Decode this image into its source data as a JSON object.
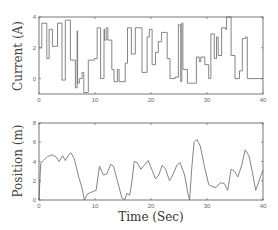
{
  "chart_data": [
    {
      "type": "line",
      "step": true,
      "title": "",
      "xlabel": "",
      "ylabel": "Current (A)",
      "xlim": [
        0,
        40
      ],
      "ylim": [
        -1,
        4
      ],
      "xticks": [
        0,
        10,
        20,
        30,
        40
      ],
      "yticks": [
        0,
        2,
        4
      ],
      "grid": false,
      "series": [
        {
          "name": "Current",
          "color": "#777777",
          "points": [
            [
              0,
              2.0
            ],
            [
              0.5,
              3.6
            ],
            [
              1.4,
              1.3
            ],
            [
              1.8,
              3.2
            ],
            [
              2.4,
              2.1
            ],
            [
              3.3,
              3.6
            ],
            [
              4.1,
              -0.1
            ],
            [
              4.7,
              3.8
            ],
            [
              5.6,
              1.2
            ],
            [
              6.5,
              -0.6
            ],
            [
              6.8,
              3.1
            ],
            [
              6.9,
              -0.3
            ],
            [
              7.2,
              0.0
            ],
            [
              7.7,
              0.4
            ],
            [
              8.0,
              -0.9
            ],
            [
              8.6,
              -0.9
            ],
            [
              8.8,
              1.2
            ],
            [
              9.9,
              1.3
            ],
            [
              10.4,
              3.3
            ],
            [
              11.0,
              0.0
            ],
            [
              11.6,
              3.2
            ],
            [
              11.7,
              2.5
            ],
            [
              12.0,
              3.3
            ],
            [
              12.3,
              2.5
            ],
            [
              13.0,
              0.6
            ],
            [
              13.4,
              -0.2
            ],
            [
              14.0,
              0.6
            ],
            [
              14.3,
              -0.2
            ],
            [
              15.4,
              1.0
            ],
            [
              15.8,
              3.3
            ],
            [
              16.5,
              1.6
            ],
            [
              17.2,
              3.3
            ],
            [
              18.4,
              0.4
            ],
            [
              19.3,
              2.7
            ],
            [
              19.7,
              3.2
            ],
            [
              20.2,
              0.9
            ],
            [
              20.8,
              1.7
            ],
            [
              21.3,
              2.4
            ],
            [
              21.9,
              3.0
            ],
            [
              22.9,
              1.3
            ],
            [
              23.4,
              0.0
            ],
            [
              24.3,
              0.1
            ],
            [
              24.9,
              3.5
            ],
            [
              25.3,
              -0.2
            ],
            [
              25.5,
              3.6
            ],
            [
              25.7,
              0.6
            ],
            [
              26.5,
              -0.3
            ],
            [
              27.7,
              -0.3
            ],
            [
              28.1,
              1.4
            ],
            [
              28.6,
              1.1
            ],
            [
              28.9,
              1.4
            ],
            [
              29.6,
              0.9
            ],
            [
              30.3,
              0.0
            ],
            [
              30.7,
              2.9
            ],
            [
              31.3,
              1.3
            ],
            [
              31.7,
              2.7
            ],
            [
              32.0,
              1.5
            ],
            [
              32.6,
              3.3
            ],
            [
              33.3,
              3.2
            ],
            [
              33.5,
              4.0
            ],
            [
              34.3,
              1.5
            ],
            [
              35.0,
              0.0
            ],
            [
              35.8,
              0.5
            ],
            [
              36.3,
              2.6
            ],
            [
              36.9,
              2.7
            ],
            [
              37.2,
              0.0
            ]
          ]
        }
      ]
    },
    {
      "type": "line",
      "title": "",
      "xlabel": "Time (Sec)",
      "ylabel": "Position (m)",
      "xlim": [
        0,
        40
      ],
      "ylim": [
        0,
        8
      ],
      "xticks": [
        0,
        10,
        20,
        30,
        40
      ],
      "yticks": [
        0,
        2,
        4,
        6,
        8
      ],
      "grid": false,
      "series": [
        {
          "name": "Position",
          "color": "#777777",
          "points": [
            [
              0,
              0.0
            ],
            [
              0.3,
              3.8
            ],
            [
              0.8,
              4.1
            ],
            [
              1.5,
              4.5
            ],
            [
              2.3,
              4.7
            ],
            [
              3.0,
              4.5
            ],
            [
              3.6,
              4.0
            ],
            [
              4.2,
              4.6
            ],
            [
              4.7,
              4.1
            ],
            [
              5.3,
              4.7
            ],
            [
              5.7,
              4.9
            ],
            [
              6.3,
              4.3
            ],
            [
              7.0,
              2.6
            ],
            [
              7.7,
              1.2
            ],
            [
              8.1,
              0.0
            ],
            [
              8.6,
              0.6
            ],
            [
              9.3,
              0.8
            ],
            [
              10.2,
              1.0
            ],
            [
              10.8,
              3.5
            ],
            [
              11.5,
              2.6
            ],
            [
              12.1,
              2.7
            ],
            [
              12.8,
              3.7
            ],
            [
              13.3,
              3.5
            ],
            [
              14.0,
              2.0
            ],
            [
              14.8,
              0.2
            ],
            [
              15.3,
              0.0
            ],
            [
              15.7,
              0.7
            ],
            [
              16.2,
              0.5
            ],
            [
              16.6,
              2.0
            ],
            [
              17.0,
              4.0
            ],
            [
              17.5,
              3.9
            ],
            [
              18.2,
              3.2
            ],
            [
              18.8,
              3.6
            ],
            [
              19.5,
              4.1
            ],
            [
              20.2,
              3.1
            ],
            [
              20.8,
              2.2
            ],
            [
              21.4,
              2.6
            ],
            [
              22.0,
              3.6
            ],
            [
              22.6,
              3.2
            ],
            [
              23.3,
              2.0
            ],
            [
              23.9,
              2.6
            ],
            [
              24.6,
              3.6
            ],
            [
              25.2,
              3.9
            ],
            [
              26.0,
              2.6
            ],
            [
              26.6,
              0.6
            ],
            [
              26.9,
              0.0
            ],
            [
              27.3,
              3.5
            ],
            [
              27.7,
              6.0
            ],
            [
              28.2,
              6.3
            ],
            [
              28.8,
              5.6
            ],
            [
              29.5,
              3.6
            ],
            [
              30.3,
              1.6
            ],
            [
              30.9,
              1.4
            ],
            [
              31.6,
              1.3
            ],
            [
              32.4,
              1.8
            ],
            [
              33.1,
              1.7
            ],
            [
              33.7,
              1.0
            ],
            [
              34.3,
              3.2
            ],
            [
              34.9,
              3.0
            ],
            [
              35.5,
              2.4
            ],
            [
              36.2,
              3.6
            ],
            [
              36.8,
              5.2
            ],
            [
              37.5,
              4.6
            ],
            [
              38.2,
              2.6
            ],
            [
              38.7,
              1.0
            ],
            [
              39.3,
              2.0
            ],
            [
              40.0,
              3.1
            ]
          ]
        }
      ]
    }
  ]
}
